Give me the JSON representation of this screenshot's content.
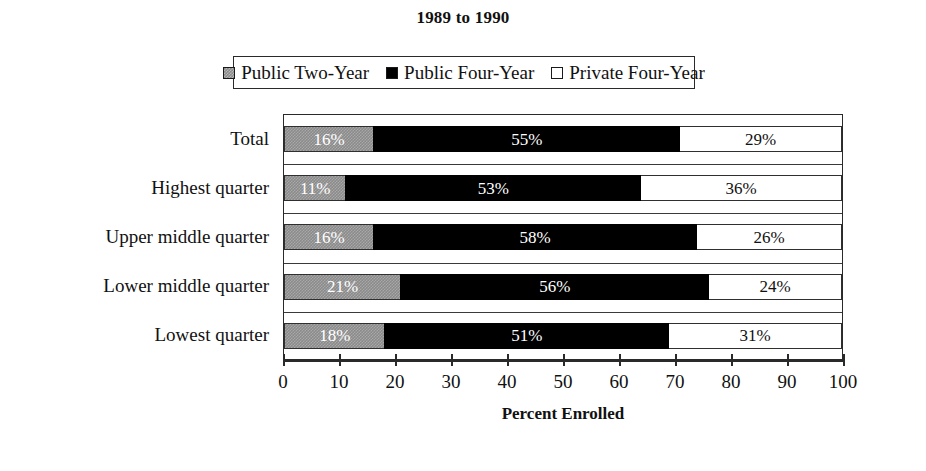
{
  "chart_data": {
    "type": "bar",
    "orientation": "horizontal",
    "stacked": true,
    "title": "1989 to 1990",
    "xlabel": "Percent Enrolled",
    "ylabel": "",
    "xlim": [
      0,
      100
    ],
    "xticks": [
      0,
      10,
      20,
      30,
      40,
      50,
      60,
      70,
      80,
      90,
      100
    ],
    "grid": false,
    "legend_position": "top",
    "categories": [
      "Total",
      "Highest quarter",
      "Upper middle quarter",
      "Lower middle quarter",
      "Lowest quarter"
    ],
    "series": [
      {
        "name": "Public Two-Year",
        "color": "#8a8a8a",
        "values": [
          16,
          11,
          16,
          21,
          18
        ],
        "labels": [
          "16%",
          "11%",
          "16%",
          "21%",
          "18%"
        ]
      },
      {
        "name": "Public Four-Year",
        "color": "#000000",
        "values": [
          55,
          53,
          58,
          56,
          51
        ],
        "labels": [
          "55%",
          "53%",
          "58%",
          "56%",
          "51%"
        ]
      },
      {
        "name": "Private Four-Year",
        "color": "#ffffff",
        "values": [
          29,
          36,
          26,
          24,
          31
        ],
        "labels": [
          "29%",
          "36%",
          "26%",
          "24%",
          "31%"
        ]
      }
    ]
  },
  "legend": {
    "entries": [
      {
        "label": "Public Two-Year",
        "swatch": "gray"
      },
      {
        "label": "Public Four-Year",
        "swatch": "black"
      },
      {
        "label": "Private Four-Year",
        "swatch": "white"
      }
    ]
  }
}
